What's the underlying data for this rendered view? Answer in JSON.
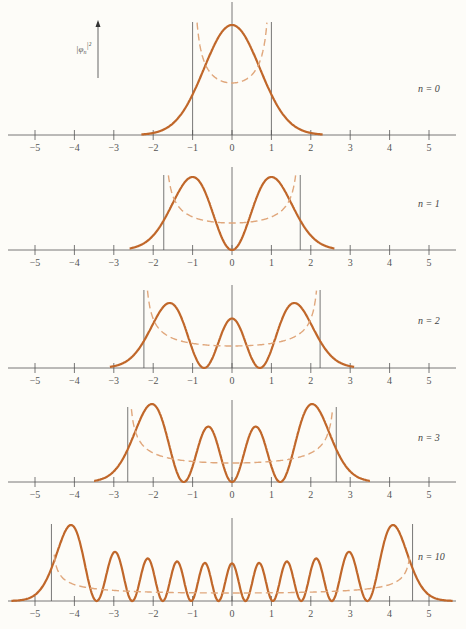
{
  "chart_data": {
    "type": "line",
    "ylabel": "|φ_n|²",
    "xlabel": "",
    "xlim": [
      -5.5,
      5.5
    ],
    "x_ticks": [
      -5,
      -4,
      -3,
      -2,
      -1,
      0,
      1,
      2,
      3,
      4,
      5
    ],
    "x_tick_labels": [
      "−5",
      "−4",
      "−3",
      "−2",
      "−1",
      "0",
      "1",
      "2",
      "3",
      "4",
      "5"
    ],
    "grid": false,
    "legend": "none",
    "colors": {
      "quantum": "#c0672a",
      "classical": "#e0a77c",
      "axis": "#555555"
    },
    "panels": [
      {
        "n": 0,
        "label": "n = 0",
        "turning_points": [
          -1.0,
          1.0
        ],
        "peaks_x": [
          0
        ],
        "series": [
          {
            "name": "quantum |phi_0|^2",
            "style": "solid"
          },
          {
            "name": "classical probability",
            "style": "dashed"
          }
        ]
      },
      {
        "n": 1,
        "label": "n = 1",
        "turning_points": [
          -1.732,
          1.732
        ],
        "peaks_x": [
          -1,
          1
        ],
        "series": [
          {
            "name": "quantum |phi_1|^2",
            "style": "solid"
          },
          {
            "name": "classical probability",
            "style": "dashed"
          }
        ]
      },
      {
        "n": 2,
        "label": "n = 2",
        "turning_points": [
          -2.236,
          2.236
        ],
        "peaks_x": [
          -1.73,
          0,
          1.73
        ],
        "series": [
          {
            "name": "quantum |phi_2|^2",
            "style": "solid"
          },
          {
            "name": "classical probability",
            "style": "dashed"
          }
        ]
      },
      {
        "n": 3,
        "label": "n = 3",
        "turning_points": [
          -2.646,
          2.646
        ],
        "peaks_x": [
          -2.0,
          -0.72,
          0.72,
          2.0
        ],
        "series": [
          {
            "name": "quantum |phi_3|^2",
            "style": "solid"
          },
          {
            "name": "classical probability",
            "style": "dashed"
          }
        ]
      },
      {
        "n": 10,
        "label": "n = 10",
        "turning_points": [
          -4.583,
          4.583
        ],
        "peaks_x": [
          -4.1,
          -3.0,
          -2.05,
          -1.3,
          -0.6,
          0,
          0.6,
          1.3,
          2.05,
          3.0,
          4.1
        ],
        "series": [
          {
            "name": "quantum |phi_10|^2",
            "style": "solid"
          },
          {
            "name": "classical probability",
            "style": "dashed"
          }
        ]
      }
    ]
  },
  "labels": {
    "ylabel": "|φ",
    "ylabel_sub": "n",
    "ylabel_sup": "|²",
    "n0": "n = 0",
    "n1": "n = 1",
    "n2": "n = 2",
    "n3": "n = 3",
    "n10": "n = 10"
  }
}
